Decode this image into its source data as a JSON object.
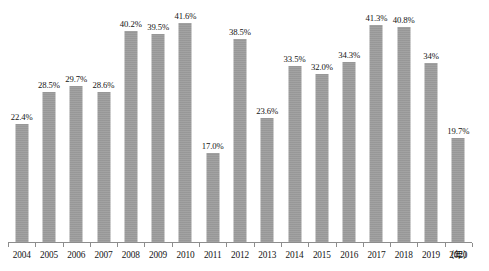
{
  "chart_data": {
    "type": "bar",
    "title": "",
    "subtitle": "",
    "xlabel": "年",
    "ylabel": "",
    "ylim": [
      0,
      46
    ],
    "grid": false,
    "legend": null,
    "axis_unit_label": "（年）",
    "categories": [
      "2004",
      "2005",
      "2006",
      "2007",
      "2008",
      "2009",
      "2010",
      "2011",
      "2012",
      "2013",
      "2014",
      "2015",
      "2016",
      "2017",
      "2018",
      "2019",
      "2020"
    ],
    "values": [
      22.4,
      28.5,
      29.7,
      28.6,
      40.2,
      39.5,
      41.6,
      17.0,
      38.5,
      23.6,
      33.5,
      32.0,
      34.3,
      41.3,
      40.8,
      34.0,
      19.7
    ],
    "value_labels": [
      "22.4%",
      "28.5%",
      "29.7%",
      "28.6%",
      "40.2%",
      "39.5%",
      "41.6%",
      "17.0%",
      "38.5%",
      "23.6%",
      "33.5%",
      "32.0%",
      "34.3%",
      "41.3%",
      "40.8%",
      "34%",
      "19.7%"
    ],
    "bar_color": "#9d9d9d",
    "axis_color": "#8d8d8d",
    "background_color": "#ffffff",
    "text_color": "#141414"
  }
}
